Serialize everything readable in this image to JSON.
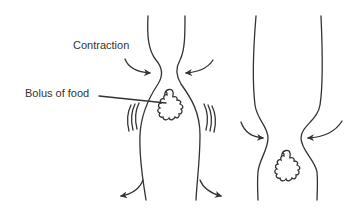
{
  "diagram": {
    "colors": {
      "stroke": "#333333",
      "text": "#333333",
      "background": "#ffffff"
    },
    "labels": {
      "contraction": "Contraction",
      "bolus": "Bolus of food"
    },
    "panels": [
      {
        "name": "stage-1",
        "description": "Contraction above bolus, walls bulge outward around bolus, arrows push down"
      },
      {
        "name": "stage-2",
        "description": "Contraction moved lower, bolus below constriction"
      }
    ]
  }
}
